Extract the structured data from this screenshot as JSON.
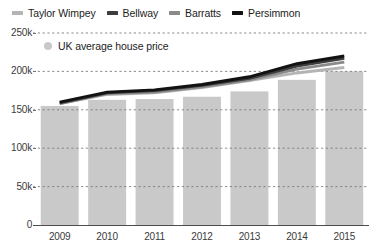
{
  "chart_data": {
    "type": "bar",
    "title": "",
    "subtitle": "",
    "xlabel": "",
    "ylabel": "",
    "categories": [
      "2009",
      "2010",
      "2011",
      "2012",
      "2013",
      "2014",
      "2015"
    ],
    "ylim": [
      0,
      250000
    ],
    "ytick_values": [
      0,
      50000,
      100000,
      150000,
      200000,
      250000
    ],
    "ytick_labels": [
      "0",
      "50k",
      "100k",
      "150k",
      "200k",
      "250k"
    ],
    "grid": true,
    "grid_style": "dashed-horizontal",
    "legend_position": "top",
    "bar_series": {
      "name": "UK average house price",
      "color": "#c9c9c9",
      "values": [
        155000,
        163000,
        164000,
        167000,
        174000,
        189000,
        200000
      ]
    },
    "series": [
      {
        "name": "Taylor Wimpey",
        "color": "#b4b4b4",
        "values": [
          158000,
          170000,
          172000,
          179000,
          188000,
          198000,
          205000
        ]
      },
      {
        "name": "Bellway",
        "color": "#3d3d3d",
        "values": [
          159000,
          172000,
          175000,
          182000,
          191000,
          207000,
          217000
        ]
      },
      {
        "name": "Barratts",
        "color": "#8a8a8a",
        "values": [
          158000,
          171000,
          173000,
          180000,
          189000,
          203000,
          212000
        ]
      },
      {
        "name": "Persimmon",
        "color": "#121212",
        "values": [
          160000,
          173000,
          176000,
          183000,
          193000,
          210000,
          220000
        ]
      }
    ]
  },
  "legend": {
    "items": [
      {
        "label": "Taylor Wimpey",
        "color": "#b4b4b4",
        "swatch": "dash-swatch"
      },
      {
        "label": "Bellway",
        "color": "#3d3d3d",
        "swatch": "dash-swatch"
      },
      {
        "label": "Barratts",
        "color": "#8a8a8a",
        "swatch": "dash-swatch"
      },
      {
        "label": "Persimmon",
        "color": "#121212",
        "swatch": "dash-swatch"
      }
    ]
  },
  "sublegend": {
    "label": "UK average house price",
    "color": "#c9c9c9",
    "marker": "circle-dot"
  },
  "axes": {
    "y_labels": [
      "250k",
      "200k",
      "150k",
      "100k",
      "50k",
      "0"
    ],
    "x_labels": [
      "2009",
      "2010",
      "2011",
      "2012",
      "2013",
      "2014",
      "2015"
    ]
  }
}
